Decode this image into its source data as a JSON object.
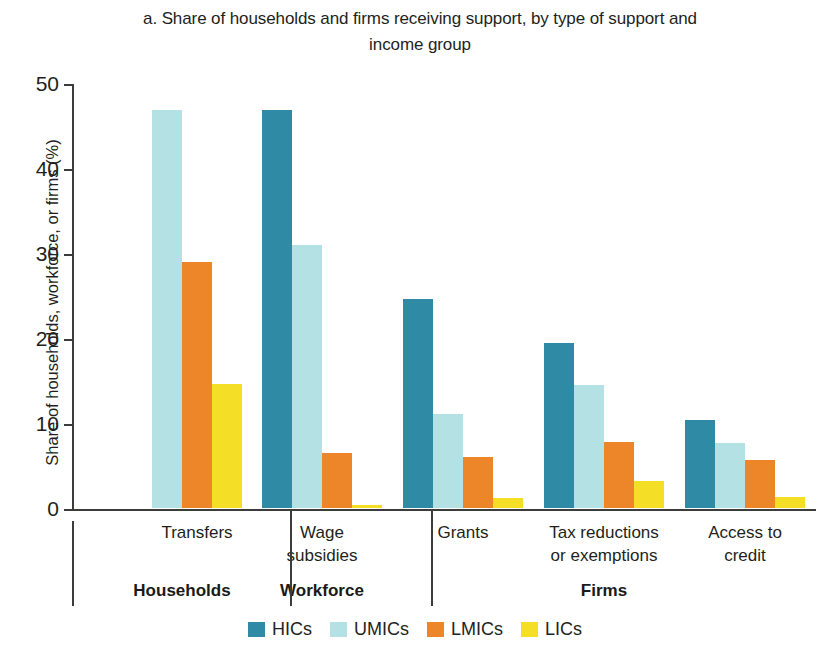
{
  "chart_data": {
    "type": "bar",
    "title": "a. Share of households and firms receiving support, by type of support and income group",
    "title_line1": "a. Share of households and firms receiving support, by type of support and",
    "title_line2": "income group",
    "xlabel": "",
    "ylabel": "Share of households, workforce, or firms (%)",
    "ylim": [
      0,
      50
    ],
    "yticks": [
      0,
      10,
      20,
      30,
      40,
      50
    ],
    "ytick_labels": [
      "0",
      "10",
      "20",
      "30",
      "40",
      "50"
    ],
    "grid": false,
    "legend_position": "bottom",
    "categories": [
      "Transfers",
      "Wage subsidies",
      "Grants",
      "Tax reductions or exemptions",
      "Access to credit"
    ],
    "category_lines": [
      [
        "Transfers"
      ],
      [
        "Wage",
        "subsidies"
      ],
      [
        "Grants"
      ],
      [
        "Tax reductions",
        "or exemptions"
      ],
      [
        "Access to",
        "credit"
      ]
    ],
    "supergroups": [
      {
        "label": "Households",
        "categories": [
          "Transfers"
        ]
      },
      {
        "label": "Workforce",
        "categories": [
          "Wage subsidies"
        ]
      },
      {
        "label": "Firms",
        "categories": [
          "Grants",
          "Tax reductions or exemptions",
          "Access to credit"
        ]
      }
    ],
    "series": [
      {
        "name": "HICs",
        "color": "#2f8ba5",
        "values": [
          null,
          46.8,
          24.6,
          19.4,
          10.3
        ]
      },
      {
        "name": "UMICs",
        "color": "#b4e2e4",
        "values": [
          46.8,
          31.0,
          11.1,
          14.5,
          7.6
        ]
      },
      {
        "name": "LMICs",
        "color": "#ec8629",
        "values": [
          29.0,
          6.5,
          6.0,
          7.8,
          5.7
        ]
      },
      {
        "name": "LICs",
        "color": "#f4df26",
        "values": [
          14.6,
          0.4,
          1.2,
          3.2,
          1.3
        ]
      }
    ]
  },
  "legend": {
    "items": [
      {
        "label": "HICs",
        "color": "#2f8ba5"
      },
      {
        "label": "UMICs",
        "color": "#b4e2e4"
      },
      {
        "label": "LMICs",
        "color": "#ec8629"
      },
      {
        "label": "LICs",
        "color": "#f4df26"
      }
    ]
  }
}
